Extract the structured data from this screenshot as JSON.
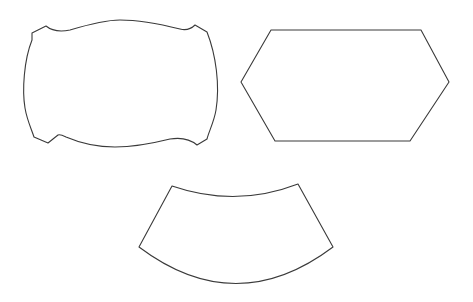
{
  "diagram": {
    "background": "#ffffff",
    "stroke_color": "#3a3a3a",
    "shapes": [
      {
        "id": "ornate-frame",
        "kind": "scalloped-rectangle-with-notched-corners",
        "bbox": [
          24,
          20,
          218,
          147
        ]
      },
      {
        "id": "hexagon",
        "kind": "elongated-hexagon",
        "vertices": [
          [
            271,
            30
          ],
          [
            421,
            30
          ],
          [
            449,
            82
          ],
          [
            410,
            141
          ],
          [
            275,
            141
          ],
          [
            241,
            82
          ]
        ]
      },
      {
        "id": "arc-band",
        "kind": "annular-sector",
        "corners": [
          [
            172,
            186
          ],
          [
            298,
            184
          ],
          [
            333,
            247
          ],
          [
            139,
            247
          ]
        ]
      }
    ]
  }
}
